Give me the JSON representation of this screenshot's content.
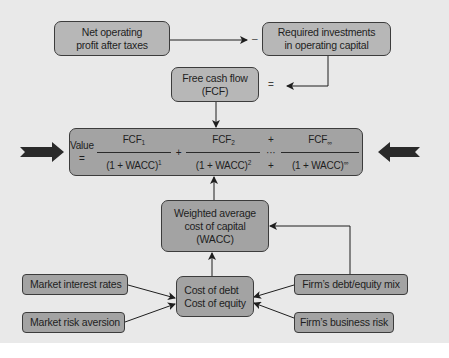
{
  "diagram": {
    "boxes": {
      "nopat": {
        "line1": "Net operating",
        "line2": "profit after taxes"
      },
      "investments": {
        "line1": "Required investments",
        "line2": "in operating capital"
      },
      "fcf": {
        "line1": "Free cash flow",
        "line2": "(FCF)"
      },
      "wacc": {
        "line1": "Weighted average",
        "line2": "cost of capital",
        "line3": "(WACC)"
      },
      "cost": {
        "line1": "Cost of debt",
        "line2": "Cost of equity"
      },
      "market_rates": {
        "label": "Market interest rates"
      },
      "market_risk": {
        "label": "Market risk aversion"
      },
      "debt_equity_mix": {
        "label": "Firm’s debt/equity mix"
      },
      "business_risk": {
        "label": "Firm’s business risk"
      }
    },
    "operators": {
      "minus": "–",
      "equals": "="
    },
    "formula": {
      "lhs": "Value =",
      "term1": {
        "num": "FCF",
        "num_sub": "1",
        "den": "(1 + WACC)",
        "den_sup": "1"
      },
      "plus1": "+",
      "term2": {
        "num": "FCF",
        "num_sub": "2",
        "den": "(1 + WACC)",
        "den_sup": "2"
      },
      "ellipsis": "+ ··· +",
      "term3": {
        "num": "FCF",
        "num_sub": "∞",
        "den": "(1 + WACC)",
        "den_sup": "∞"
      }
    },
    "colors": {
      "background": "#e9e9e9",
      "box_fill": "#a3a3a3",
      "box_border": "#3c3c3c",
      "arrow": "#1e1e1e"
    }
  }
}
